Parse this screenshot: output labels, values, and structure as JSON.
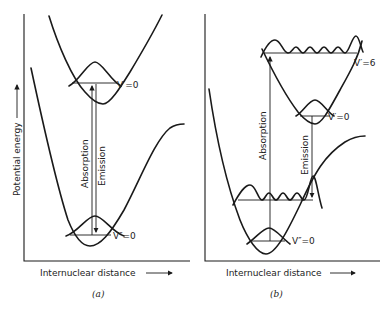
{
  "panels": [
    {
      "id": "a",
      "caption": "(a)",
      "xlabel": "Internuclear distance",
      "ylabel": "Potential energy",
      "upper_level": "V′=0",
      "lower_level": "V″=0",
      "absorption_label": "Absorption",
      "emission_label": "Emission"
    },
    {
      "id": "b",
      "caption": "(b)",
      "xlabel": "Internuclear distance",
      "upper_high_level": "V′=6",
      "upper_level": "V′=0",
      "lower_level": "V″=0",
      "absorption_label": "Absorption",
      "emission_label": "Emission"
    }
  ]
}
